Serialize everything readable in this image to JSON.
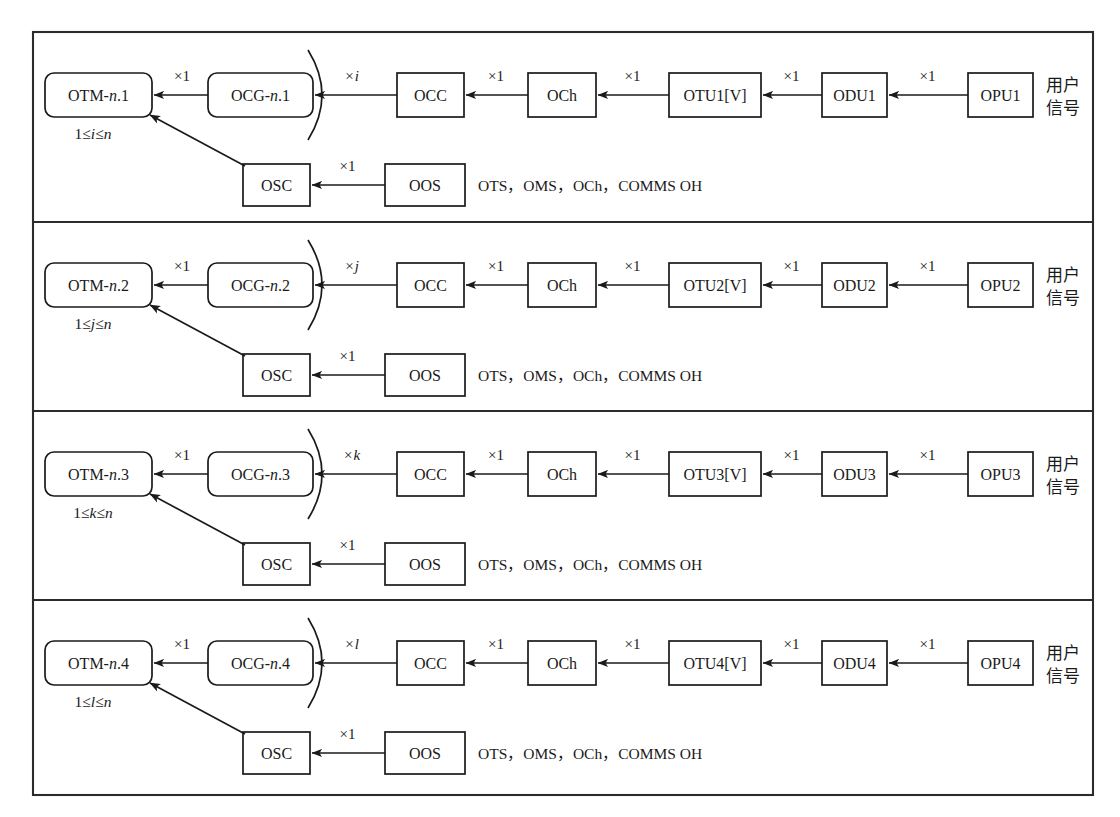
{
  "figure": {
    "frame": {
      "x": 33,
      "y": 32,
      "width": 1060,
      "height": 763
    },
    "panel_count": 4,
    "panel_dividers_y": [
      222,
      411,
      600
    ]
  },
  "labels": {
    "multiplier_one": "×1",
    "user_signal_line1": "用户",
    "user_signal_line2": "信号",
    "overhead_note": "OTS，OMS，OCh，COMMS OH",
    "osc_box": "OSC",
    "oos_box": "OOS",
    "occ_box": "OCC",
    "och_box": "OCh"
  },
  "rows": [
    {
      "otm": "OTM-n.1",
      "otm_italic_part": "n",
      "range": "1≤i≤n",
      "range_var": "i",
      "ocg": "OCG-n.1",
      "arc_multiplier": "×i",
      "arc_multiplier_var": "i",
      "occ": "OCC",
      "och": "OCh",
      "otu": "OTU1[V]",
      "odu": "ODU1",
      "opu": "OPU1",
      "osc": "OSC",
      "oos": "OOS",
      "note": "OTS，OMS，OCh，COMMS OH",
      "user_signal_line1": "用户",
      "user_signal_line2": "信号",
      "mult_otm_ocg": "×1",
      "mult_occ_och": "×1",
      "mult_och_otu": "×1",
      "mult_otu_odu": "×1",
      "mult_odu_opu": "×1",
      "mult_oos_osc": "×1"
    },
    {
      "otm": "OTM-n.2",
      "otm_italic_part": "n",
      "range": "1≤j≤n",
      "range_var": "j",
      "ocg": "OCG-n.2",
      "arc_multiplier": "×j",
      "arc_multiplier_var": "j",
      "occ": "OCC",
      "och": "OCh",
      "otu": "OTU2[V]",
      "odu": "ODU2",
      "opu": "OPU2",
      "osc": "OSC",
      "oos": "OOS",
      "note": "OTS，OMS，OCh，COMMS OH",
      "user_signal_line1": "用户",
      "user_signal_line2": "信号",
      "mult_otm_ocg": "×1",
      "mult_occ_och": "×1",
      "mult_och_otu": "×1",
      "mult_otu_odu": "×1",
      "mult_odu_opu": "×1",
      "mult_oos_osc": "×1"
    },
    {
      "otm": "OTM-n.3",
      "otm_italic_part": "n",
      "range": "1≤k≤n",
      "range_var": "k",
      "ocg": "OCG-n.3",
      "arc_multiplier": "×k",
      "arc_multiplier_var": "k",
      "occ": "OCC",
      "och": "OCh",
      "otu": "OTU3[V]",
      "odu": "ODU3",
      "opu": "OPU3",
      "osc": "OSC",
      "oos": "OOS",
      "note": "OTS，OMS，OCh，COMMS OH",
      "user_signal_line1": "用户",
      "user_signal_line2": "信号",
      "mult_otm_ocg": "×1",
      "mult_occ_och": "×1",
      "mult_och_otu": "×1",
      "mult_otu_odu": "×1",
      "mult_odu_opu": "×1",
      "mult_oos_osc": "×1"
    },
    {
      "otm": "OTM-n.4",
      "otm_italic_part": "n",
      "range": "1≤l≤n",
      "range_var": "l",
      "ocg": "OCG-n.4",
      "arc_multiplier": "×l",
      "arc_multiplier_var": "l",
      "occ": "OCC",
      "och": "OCh",
      "otu": "OTU4[V]",
      "odu": "ODU4",
      "opu": "OPU4",
      "osc": "OSC",
      "oos": "OOS",
      "note": "OTS，OMS，OCh，COMMS OH",
      "user_signal_line1": "用户",
      "user_signal_line2": "信号",
      "mult_otm_ocg": "×1",
      "mult_occ_och": "×1",
      "mult_och_otu": "×1",
      "mult_otu_odu": "×1",
      "mult_odu_opu": "×1",
      "mult_oos_osc": "×1"
    }
  ],
  "colors": {
    "ink": "#1a1a1a",
    "frame": "#2b2b2b",
    "background": "#ffffff"
  }
}
